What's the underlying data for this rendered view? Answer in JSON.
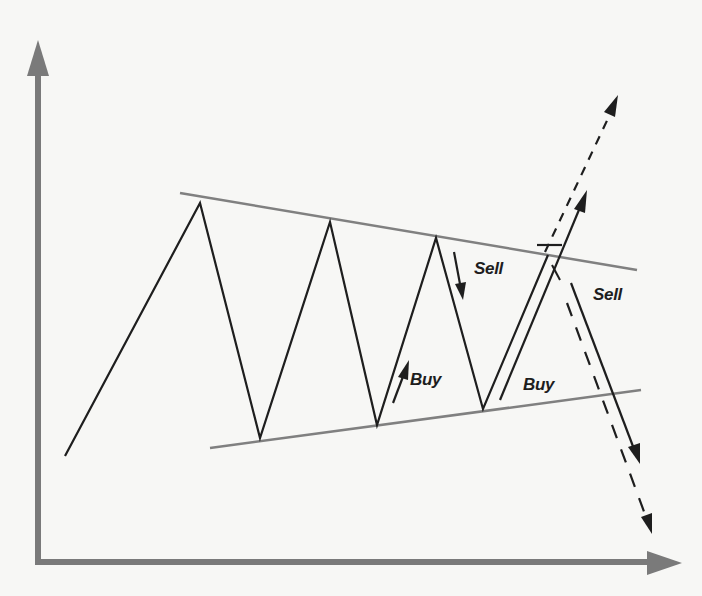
{
  "diagram": {
    "type": "symmetrical-triangle-trading-pattern",
    "colors": {
      "background": "#f7f7f5",
      "axis": "#7a7a7a",
      "trendline": "#808080",
      "price": "#1e1e1e"
    },
    "axes": {
      "y_axis": {
        "x": 38,
        "top": 40,
        "bottom": 562
      },
      "x_axis": {
        "y": 562,
        "left": 38,
        "right": 682
      }
    },
    "price_path": [
      [
        65,
        456
      ],
      [
        200,
        203
      ],
      [
        260,
        438
      ],
      [
        330,
        222
      ],
      [
        377,
        425
      ],
      [
        436,
        238
      ],
      [
        483,
        409
      ],
      [
        548,
        255
      ]
    ],
    "trendlines": {
      "upper": [
        [
          180,
          193
        ],
        [
          637,
          270
        ]
      ],
      "lower": [
        [
          210,
          448
        ],
        [
          641,
          390
        ]
      ]
    },
    "signals": [
      {
        "kind": "buy-arrow",
        "from": [
          393,
          402
        ],
        "to": [
          408,
          360
        ]
      },
      {
        "kind": "sell-arrow",
        "from": [
          454,
          252
        ],
        "to": [
          463,
          300
        ]
      },
      {
        "kind": "breakout-up-solid",
        "from": [
          500,
          400
        ],
        "to": [
          586,
          192
        ]
      },
      {
        "kind": "breakout-up-dashed",
        "from": [
          545,
          252
        ],
        "to": [
          618,
          96
        ]
      },
      {
        "kind": "breakdown-solid",
        "from": [
          571,
          283
        ],
        "to": [
          639,
          462
        ]
      },
      {
        "kind": "breakdown-dashed",
        "from": [
          567,
          305
        ],
        "to": [
          652,
          533
        ]
      }
    ],
    "labels": {
      "sell_1": "Sell",
      "buy_1": "Buy",
      "buy_2": "Buy",
      "sell_2": "Sell"
    }
  }
}
